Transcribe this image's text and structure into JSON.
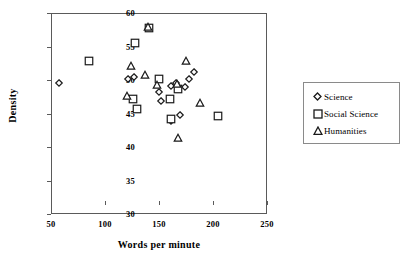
{
  "chart_data": {
    "type": "scatter",
    "title": "",
    "xlabel": "Words per minute",
    "ylabel": "Density",
    "xlim": [
      50,
      250
    ],
    "ylim": [
      30,
      60
    ],
    "xticks": [
      50,
      100,
      150,
      200,
      250
    ],
    "yticks": [
      30,
      35,
      40,
      45,
      50,
      55,
      60
    ],
    "grid": false,
    "legend_position": "right",
    "series": [
      {
        "name": "Science",
        "marker": "diamond",
        "color": "#000000",
        "points": [
          [
            57,
            49.6
          ],
          [
            121,
            50.2
          ],
          [
            127,
            50.4
          ],
          [
            150,
            48.2
          ],
          [
            152,
            46.8
          ],
          [
            161,
            49.1
          ],
          [
            166,
            49.6
          ],
          [
            174,
            49.0
          ],
          [
            178,
            50.1
          ],
          [
            182,
            51.2
          ],
          [
            161,
            43.9
          ],
          [
            169,
            44.8
          ]
        ]
      },
      {
        "name": "Social Science",
        "marker": "square",
        "color": "#000000",
        "points": [
          [
            85,
            52.8
          ],
          [
            128,
            55.5
          ],
          [
            141,
            57.8
          ],
          [
            126,
            47.2
          ],
          [
            130,
            45.7
          ],
          [
            150,
            50.1
          ],
          [
            160,
            47.2
          ],
          [
            168,
            48.6
          ],
          [
            161,
            44.2
          ],
          [
            205,
            44.6
          ]
        ]
      },
      {
        "name": "Humanities",
        "marker": "triangle",
        "color": "#000000",
        "points": [
          [
            140,
            57.9
          ],
          [
            124,
            52.1
          ],
          [
            137,
            50.8
          ],
          [
            120,
            47.6
          ],
          [
            148,
            49.3
          ],
          [
            167,
            49.4
          ],
          [
            175,
            52.9
          ],
          [
            188,
            46.5
          ],
          [
            168,
            41.4
          ]
        ]
      }
    ]
  },
  "legend": {
    "items": [
      {
        "label": "Science",
        "marker": "diamond"
      },
      {
        "label": "Social Science",
        "marker": "square"
      },
      {
        "label": "Humanities",
        "marker": "triangle"
      }
    ]
  }
}
